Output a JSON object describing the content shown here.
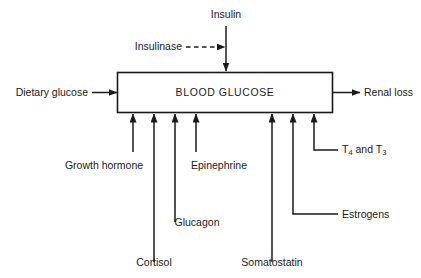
{
  "diagram": {
    "box": {
      "title": "BLOOD GLUCOSE"
    },
    "inputs_left": [
      {
        "label": "Dietary glucose"
      }
    ],
    "outputs_right": [
      {
        "label": "Renal loss"
      }
    ],
    "top": {
      "insulin_label": "Insulin",
      "insulinase_label": "Insulinase"
    },
    "bottom_labels": [
      {
        "label": "Growth hormone"
      },
      {
        "label": "Epinephrine"
      },
      {
        "label": "Glucagon"
      },
      {
        "label": "Cortisol"
      },
      {
        "label": "Somatostatin"
      },
      {
        "label": "Estrogens"
      }
    ],
    "thyroid": {
      "prefix": "T",
      "sub1": "4",
      "middle": " and T",
      "sub2": "3"
    },
    "colors": {
      "stroke": "#1a1a1a",
      "text": "#1a1a1a",
      "background": "#ffffff"
    }
  }
}
